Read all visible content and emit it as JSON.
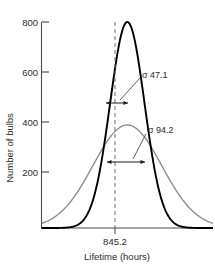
{
  "chart_data": {
    "type": "line",
    "title": "",
    "xlabel": "Lifetime (hours)",
    "ylabel": "Number of bulbs",
    "grid": false,
    "legend": "none",
    "xlim": [
      610,
      1080
    ],
    "ylim": [
      0,
      820
    ],
    "x_ticks": [
      {
        "value": 845.2,
        "label": "845.2"
      }
    ],
    "y_ticks": [
      {
        "value": 200,
        "label": "200"
      },
      {
        "value": 400,
        "label": "400"
      },
      {
        "value": 600,
        "label": "600"
      },
      {
        "value": 800,
        "label": "800"
      }
    ],
    "center_line": {
      "value": 845.2,
      "style": "dashed",
      "color": "#6e6e6e"
    },
    "series": [
      {
        "name": "narrow-distribution",
        "kind": "gaussian",
        "mean": 845.2,
        "sigma": 47.1,
        "peak": 800,
        "color": "#000000",
        "width": 1.9
      },
      {
        "name": "wide-distribution",
        "kind": "gaussian",
        "mean": 845.2,
        "sigma": 94.2,
        "peak": 400,
        "color": "#8f8f8f",
        "width": 1.4
      }
    ],
    "annotations": [
      {
        "id": "sigma-narrow",
        "symbol": "σ",
        "value": "47.1",
        "text": "σ  47.1",
        "at_y": 480,
        "from": 845.2,
        "to": 892.3
      },
      {
        "id": "sigma-wide",
        "symbol": "σ",
        "value": "94.2",
        "text": "σ  94.2",
        "at_y": 240,
        "from": 845.2,
        "to": 939.4
      }
    ]
  },
  "axes": {
    "y_title": "Number of bulbs",
    "x_title": "Lifetime (hours)",
    "x_tick_label": "845.2",
    "y_tick_labels": [
      "800",
      "600",
      "400",
      "200"
    ]
  },
  "annotations": {
    "sigma_narrow_label": "σ  47.1",
    "sigma_wide_label": "σ  94.2"
  },
  "colors": {
    "narrow_curve": "#000000",
    "wide_curve": "#8f8f8f",
    "axis": "#4a4a4a",
    "dashed_line": "#6e6e6e",
    "text": "#2b2b2b",
    "background": "#ffffff"
  }
}
